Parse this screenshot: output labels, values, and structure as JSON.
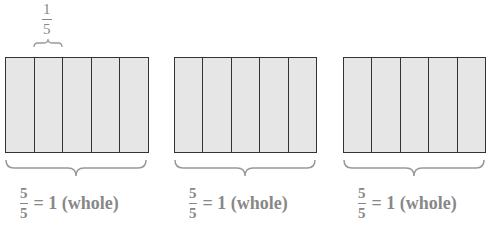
{
  "top_annotation": {
    "numerator": "1",
    "denominator": "5"
  },
  "bars": [
    {
      "segments": 5,
      "label": {
        "numerator": "5",
        "denominator": "5",
        "text": "= 1 (whole)"
      }
    },
    {
      "segments": 5,
      "label": {
        "numerator": "5",
        "denominator": "5",
        "text": "= 1 (whole)"
      }
    },
    {
      "segments": 5,
      "label": {
        "numerator": "5",
        "denominator": "5",
        "text": "= 1 (whole)"
      }
    }
  ],
  "colors": {
    "fill": "#e6e6e6",
    "stroke": "#333333",
    "text": "#888888"
  }
}
